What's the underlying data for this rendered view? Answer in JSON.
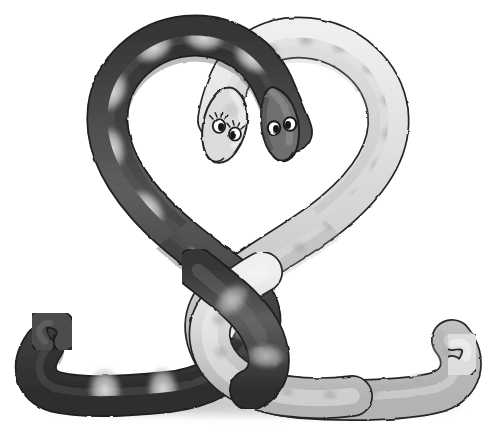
{
  "artwork": {
    "title": "Two Snakes Forming a Heart",
    "medium": "graphite pencil drawing",
    "subject": "two cartoon snakes intertwined into a heart shape",
    "background_color": "#ffffff",
    "width": 493,
    "height": 446
  },
  "palette": {
    "paper": "#ffffff",
    "ink_outline": "#1a1a1a",
    "dark_snake_base": "#4a4a4a",
    "dark_snake_shadow": "#2b2b2b",
    "dark_snake_band": "#d8d8d8",
    "light_snake_base": "#dcdcdc",
    "light_snake_shade": "#bdbdbd",
    "light_snake_spot": "#a9a9a9",
    "ground_shadow": "#b5b5b5",
    "eye_white": "#ffffff",
    "eye_pupil": "#111111"
  },
  "subjects": [
    {
      "id": "dark-snake",
      "name": "Dark banded snake",
      "side": "left",
      "body_color": "#4a4a4a",
      "pattern": "light cross-bands",
      "pattern_count": 9,
      "head_position": "center-right",
      "eyes": 2,
      "eyelashes": false,
      "tail": "curled upward at far left"
    },
    {
      "id": "light-snake",
      "name": "Light spotted snake",
      "side": "right",
      "body_color": "#dcdcdc",
      "pattern": "soft round spots",
      "pattern_count": 22,
      "head_position": "center-left",
      "eyes": 2,
      "eyelashes": true,
      "tail": "curled upward at far right"
    }
  ],
  "composition": {
    "shape": "heart",
    "left_lobe_owner": "dark-snake",
    "right_lobe_owner": "light-snake",
    "crossing_point": "lower center knot",
    "ground_line_y": 404,
    "heads_meet_at": "heart notch, center top"
  }
}
